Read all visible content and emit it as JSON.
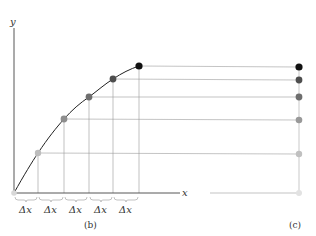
{
  "diagram": {
    "axis_x_label": "x",
    "axis_y_label": "y",
    "delta_label": "Δx",
    "caption_b": "(b)",
    "caption_c": "(c)",
    "delta_count": 5,
    "origin": [
      14,
      193
    ],
    "points": [
      {
        "x": 14,
        "y": 193,
        "color": "#e0e0e0"
      },
      {
        "x": 38,
        "y": 153,
        "color": "#c0c0c0"
      },
      {
        "x": 64,
        "y": 119,
        "color": "#999999"
      },
      {
        "x": 89,
        "y": 97,
        "color": "#777777"
      },
      {
        "x": 113,
        "y": 79,
        "color": "#555555"
      },
      {
        "x": 139,
        "y": 66,
        "color": "#111111"
      }
    ],
    "right_column_x": 299,
    "right_points_y": [
      193,
      154,
      120,
      97,
      80,
      67
    ]
  }
}
